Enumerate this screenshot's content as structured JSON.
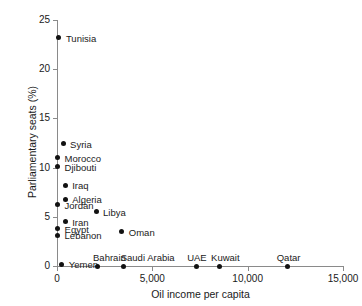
{
  "chart_data": {
    "type": "scatter",
    "title": "",
    "xlabel": "Oil income per capita",
    "ylabel": "Parliamentary seats (%)",
    "xlim": [
      0,
      15000
    ],
    "ylim": [
      0,
      25
    ],
    "xticks": [
      0,
      5000,
      10000,
      15000
    ],
    "xtick_labels": [
      "0",
      "5,000",
      "10,000",
      "15,000"
    ],
    "yticks": [
      0,
      5,
      10,
      15,
      20,
      25
    ],
    "ytick_labels": [
      "0",
      "5",
      "10",
      "15",
      "20",
      "25"
    ],
    "grid": false,
    "legend": "none",
    "marker_color": "#121212",
    "axis_color": "#8a8a8a",
    "points": [
      {
        "label": "Tunisia",
        "x": 100,
        "y": 23.2,
        "label_dx": 7,
        "label_dy": -4
      },
      {
        "label": "Syria",
        "x": 320,
        "y": 12.4,
        "label_dx": 7,
        "label_dy": -4
      },
      {
        "label": "Morocco",
        "x": 30,
        "y": 11.0,
        "label_dx": 7,
        "label_dy": -4
      },
      {
        "label": "Djibouti",
        "x": 30,
        "y": 10.1,
        "label_dx": 7,
        "label_dy": -4
      },
      {
        "label": "Iraq",
        "x": 430,
        "y": 8.2,
        "label_dx": 7,
        "label_dy": -4
      },
      {
        "label": "Algeria",
        "x": 430,
        "y": 6.8,
        "label_dx": 7,
        "label_dy": -4
      },
      {
        "label": "Jordan",
        "x": 30,
        "y": 6.2,
        "label_dx": 7,
        "label_dy": -4
      },
      {
        "label": "Libya",
        "x": 2050,
        "y": 5.5,
        "label_dx": 7,
        "label_dy": -4
      },
      {
        "label": "Iran",
        "x": 430,
        "y": 4.5,
        "label_dx": 7,
        "label_dy": -4
      },
      {
        "label": "Egypt",
        "x": 30,
        "y": 3.8,
        "label_dx": 7,
        "label_dy": -4
      },
      {
        "label": "Oman",
        "x": 3400,
        "y": 3.5,
        "label_dx": 7,
        "label_dy": -4
      },
      {
        "label": "Lebanon",
        "x": 30,
        "y": 3.1,
        "label_dx": 7,
        "label_dy": -4
      },
      {
        "label": "Yemen",
        "x": 250,
        "y": 0.2,
        "label_dx": 7,
        "label_dy": -4
      },
      {
        "label": "Bahrain",
        "x": 2100,
        "y": 0.0,
        "label_dx": -4,
        "label_dy": -13
      },
      {
        "label": "Saudi Arabia",
        "x": 3500,
        "y": 0.0,
        "label_dx": -3,
        "label_dy": -13
      },
      {
        "label": "UAE",
        "x": 7300,
        "y": 0.0,
        "label_dx": -9,
        "label_dy": -13
      },
      {
        "label": "Kuwait",
        "x": 8500,
        "y": 0.0,
        "label_dx": -8,
        "label_dy": -13
      },
      {
        "label": "Qatar",
        "x": 12100,
        "y": 0.0,
        "label_dx": -11,
        "label_dy": -13
      }
    ]
  }
}
